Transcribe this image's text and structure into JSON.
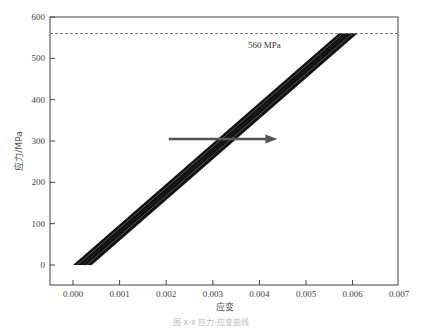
{
  "chart_data": {
    "type": "line",
    "title": "",
    "xlabel": "应变",
    "ylabel": "应力/MPa",
    "xlim": [
      -0.00045,
      0.007
    ],
    "ylim": [
      -50,
      600
    ],
    "x_ticks": [
      "0.000",
      "0.001",
      "0.002",
      "0.003",
      "0.004",
      "0.005",
      "0.006",
      "0.007"
    ],
    "y_ticks": [
      "0",
      "100",
      "200",
      "300",
      "400",
      "500",
      "600"
    ],
    "grid": false,
    "legend": null,
    "annotations": [
      {
        "type": "hline",
        "y": 560,
        "style": "dashed",
        "label": "560 MPa",
        "label_x": 0.0042
      },
      {
        "type": "arrow",
        "from": [
          0.0021,
          300
        ],
        "to": [
          0.0043,
          300
        ],
        "meaning": "band shifts right"
      }
    ],
    "series_band": {
      "description": "Family of overlapping linear stress-strain curves forming a thick dark band",
      "lower_left": {
        "x_start": 0.0,
        "x_end": 0.0004,
        "y": 0
      },
      "upper_right": {
        "x_start": 0.0057,
        "x_end": 0.0061,
        "y": 560
      }
    },
    "series": [
      {
        "name": "curve-1",
        "x": [
          0.0,
          0.0057
        ],
        "y": [
          0,
          560
        ]
      },
      {
        "name": "curve-2",
        "x": [
          0.0001,
          0.0058
        ],
        "y": [
          0,
          560
        ]
      },
      {
        "name": "curve-3",
        "x": [
          0.0002,
          0.0059
        ],
        "y": [
          0,
          560
        ]
      },
      {
        "name": "curve-4",
        "x": [
          0.0003,
          0.006
        ],
        "y": [
          0,
          560
        ]
      },
      {
        "name": "curve-5",
        "x": [
          0.0004,
          0.0061
        ],
        "y": [
          0,
          560
        ]
      }
    ]
  },
  "labels": {
    "xlabel": "应变",
    "ylabel": "应力/MPa",
    "hline_label": "560 MPa",
    "caption": "图 x-x 应力-应变曲线"
  },
  "colors": {
    "band": "#111111",
    "band_highlight": "#9a9a9a",
    "arrow": "#555555",
    "axis": "#444444",
    "dashed": "#555555"
  }
}
